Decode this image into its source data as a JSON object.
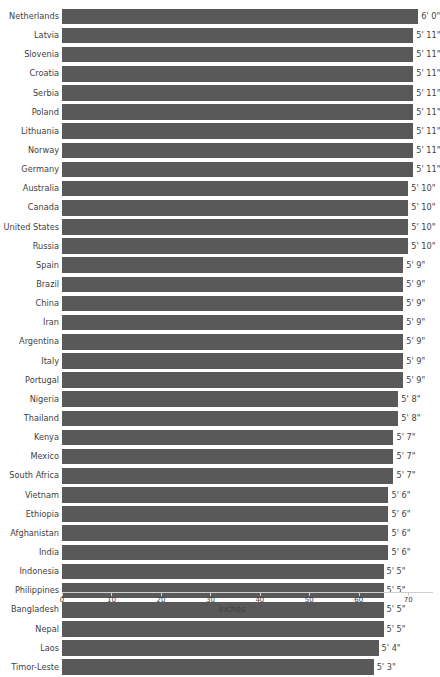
{
  "chart_data": {
    "type": "bar",
    "orientation": "horizontal",
    "title": "",
    "xlabel": "Inches",
    "ylabel": "",
    "xlim": [
      0,
      75
    ],
    "xticks": [
      0,
      10,
      20,
      30,
      40,
      50,
      60,
      70
    ],
    "xtick_labels": [
      "0",
      "10",
      "20",
      "30",
      "40",
      "50",
      "60",
      "70"
    ],
    "grid": false,
    "legend": null,
    "bar_color": "#595959",
    "text_color": "#3f3f3f",
    "axis_color": "#cfcfcf",
    "categories": [
      "Netherlands",
      "Latvia",
      "Slovenia",
      "Croatia",
      "Serbia",
      "Poland",
      "Lithuania",
      "Norway",
      "Germany",
      "Australia",
      "Canada",
      "United States",
      "Russia",
      "Spain",
      "Brazil",
      "China",
      "Iran",
      "Argentina",
      "Italy",
      "Portugal",
      "Nigeria",
      "Thailand",
      "Kenya",
      "Mexico",
      "South Africa",
      "Vietnam",
      "Ethiopia",
      "Afghanistan",
      "India",
      "Indonesia",
      "Philippines",
      "Bangladesh",
      "Nepal",
      "Laos",
      "Timor-Leste"
    ],
    "values": [
      72,
      71,
      71,
      71,
      71,
      71,
      71,
      71,
      71,
      70,
      70,
      70,
      70,
      69,
      69,
      69,
      69,
      69,
      69,
      69,
      68,
      68,
      67,
      67,
      67,
      66,
      66,
      66,
      66,
      65,
      65,
      65,
      65,
      64,
      63
    ],
    "data_labels": [
      "6' 0\"",
      "5' 11\"",
      "5' 11\"",
      "5' 11\"",
      "5' 11\"",
      "5' 11\"",
      "5' 11\"",
      "5' 11\"",
      "5' 11\"",
      "5' 10\"",
      "5' 10\"",
      "5' 10\"",
      "5' 10\"",
      "5' 9\"",
      "5' 9\"",
      "5' 9\"",
      "5' 9\"",
      "5' 9\"",
      "5' 9\"",
      "5' 9\"",
      "5' 8\"",
      "5' 8\"",
      "5' 7\"",
      "5' 7\"",
      "5' 7\"",
      "5' 6\"",
      "5' 6\"",
      "5' 6\"",
      "5' 6\"",
      "5' 5\"",
      "5' 5\"",
      "5' 5\"",
      "5' 5\"",
      "5' 4\"",
      "5' 3\""
    ]
  }
}
